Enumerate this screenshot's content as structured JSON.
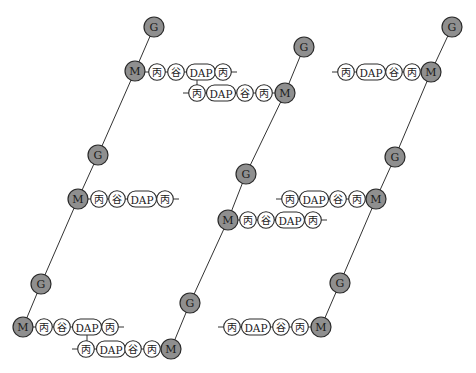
{
  "diagram": {
    "title": "",
    "labels": {
      "G": "G",
      "M": "M",
      "ala": "丙",
      "glu": "谷",
      "dap": "DAP"
    },
    "colors": {
      "sugar_fill": "#8f8f8f",
      "residue_fill": "#ffffff",
      "stroke": "#2a2a2a"
    },
    "strands": [
      {
        "name": "left-strand",
        "nodes": [
          {
            "type": "G",
            "x": 154,
            "y": 27
          },
          {
            "type": "M",
            "x": 135,
            "y": 71
          },
          {
            "type": "G",
            "x": 98,
            "y": 155
          },
          {
            "type": "M",
            "x": 78,
            "y": 199
          },
          {
            "type": "G",
            "x": 41,
            "y": 284
          },
          {
            "type": "M",
            "x": 23,
            "y": 327
          }
        ]
      },
      {
        "name": "middle-strand",
        "nodes": [
          {
            "type": "G",
            "x": 304,
            "y": 47
          },
          {
            "type": "M",
            "x": 285,
            "y": 93
          },
          {
            "type": "G",
            "x": 246,
            "y": 174
          },
          {
            "type": "M",
            "x": 228,
            "y": 220
          },
          {
            "type": "G",
            "x": 190,
            "y": 303
          },
          {
            "type": "M",
            "x": 171,
            "y": 349
          }
        ]
      },
      {
        "name": "right-strand",
        "nodes": [
          {
            "type": "G",
            "x": 452,
            "y": 27
          },
          {
            "type": "M",
            "x": 431,
            "y": 72
          },
          {
            "type": "G",
            "x": 395,
            "y": 157
          },
          {
            "type": "M",
            "x": 376,
            "y": 199
          },
          {
            "type": "G",
            "x": 340,
            "y": 283
          },
          {
            "type": "M",
            "x": 321,
            "y": 327
          }
        ]
      }
    ],
    "peptides": [
      {
        "name": "peptide-left-top",
        "y": 72,
        "items": [
          [
            "丙",
            157
          ],
          [
            "谷",
            176
          ],
          [
            "DAP",
            201
          ],
          [
            "丙",
            223
          ]
        ]
      },
      {
        "name": "peptide-middle-top",
        "y": 93,
        "items": [
          [
            "丙",
            197
          ],
          [
            "DAP",
            221
          ],
          [
            "谷",
            245
          ],
          [
            "丙",
            264
          ]
        ]
      },
      {
        "name": "peptide-right-top",
        "y": 72,
        "items": [
          [
            "丙",
            346
          ],
          [
            "DAP",
            371
          ],
          [
            "谷",
            394
          ],
          [
            "丙",
            412
          ]
        ]
      },
      {
        "name": "peptide-left-mid",
        "y": 199,
        "items": [
          [
            "丙",
            99
          ],
          [
            "谷",
            117
          ],
          [
            "DAP",
            142
          ],
          [
            "丙",
            165
          ]
        ]
      },
      {
        "name": "peptide-right-mid",
        "y": 199,
        "items": [
          [
            "丙",
            290
          ],
          [
            "DAP",
            314
          ],
          [
            "谷",
            338
          ],
          [
            "丙",
            357
          ]
        ]
      },
      {
        "name": "peptide-middle-mid",
        "y": 220,
        "items": [
          [
            "丙",
            248
          ],
          [
            "谷",
            266
          ],
          [
            "DAP",
            290
          ],
          [
            "丙",
            313
          ]
        ]
      },
      {
        "name": "peptide-left-bottom",
        "y": 327,
        "items": [
          [
            "丙",
            44
          ],
          [
            "谷",
            62
          ],
          [
            "DAP",
            87
          ],
          [
            "丙",
            110
          ]
        ]
      },
      {
        "name": "peptide-middle-bottom",
        "y": 349,
        "items": [
          [
            "丙",
            86
          ],
          [
            "DAP",
            111
          ],
          [
            "谷",
            133
          ],
          [
            "丙",
            152
          ]
        ]
      },
      {
        "name": "peptide-right-bottom",
        "y": 327,
        "items": [
          [
            "丙",
            232
          ],
          [
            "DAP",
            256
          ],
          [
            "谷",
            281
          ],
          [
            "丙",
            300
          ]
        ]
      }
    ],
    "crosslinks": [
      {
        "name": "crosslink-top",
        "x": 197,
        "y1": 80,
        "y2": 85
      },
      {
        "name": "crosslink-bottom",
        "x": 87,
        "y1": 335,
        "y2": 341
      }
    ]
  }
}
